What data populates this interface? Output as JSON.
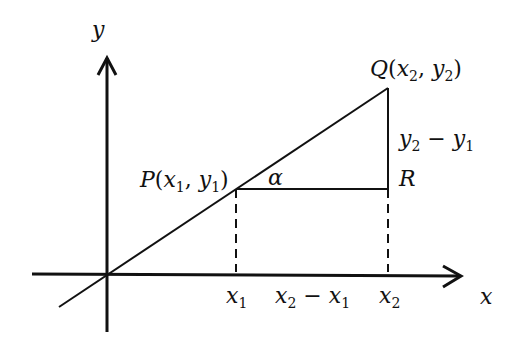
{
  "diagram": {
    "type": "slope-triangle",
    "axes": {
      "x_label": "x",
      "y_label": "y"
    },
    "points": {
      "P": {
        "name": "P",
        "x_sub": "1",
        "y_sub": "1"
      },
      "Q": {
        "name": "Q",
        "x_sub": "2",
        "y_sub": "2"
      },
      "R": {
        "name": "R"
      }
    },
    "angle_label": "α",
    "rise_label": {
      "a": "y",
      "a_sub": "2",
      "op": "−",
      "b": "y",
      "b_sub": "1"
    },
    "run_label": {
      "a": "x",
      "a_sub": "2",
      "op": "−",
      "b": "x",
      "b_sub": "1"
    },
    "x_ticks": [
      {
        "base": "x",
        "sub": "1"
      },
      {
        "base": "x",
        "sub": "2"
      }
    ],
    "colors": {
      "stroke": "#111111",
      "background": "#ffffff"
    }
  }
}
